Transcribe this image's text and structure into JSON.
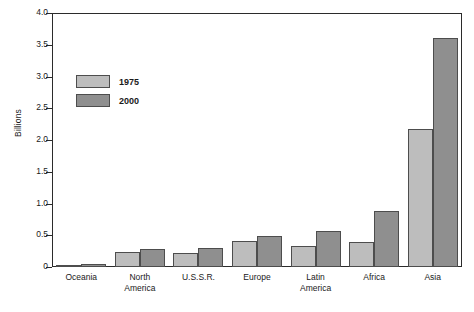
{
  "chart_data": {
    "type": "bar",
    "title": "",
    "xlabel": "",
    "ylabel": "Billions",
    "ylim": [
      0,
      4.0
    ],
    "ytick_labels": [
      "4.0",
      "3.5",
      "3.0",
      "2.5",
      "2.0",
      "1.5",
      "1.0",
      "0.5",
      "0"
    ],
    "ytick_values": [
      4.0,
      3.5,
      3.0,
      2.5,
      2.0,
      1.5,
      1.0,
      0.5,
      0
    ],
    "grid": false,
    "legend_position": "upper-left-inside",
    "categories": [
      "Oceania",
      "North America",
      "U.S.S.R.",
      "Europe",
      "Latin America",
      "Africa",
      "Asia"
    ],
    "category_lines": [
      [
        "Oceania"
      ],
      [
        "North",
        "America"
      ],
      [
        "U.S.S.R."
      ],
      [
        "Europe"
      ],
      [
        "Latin",
        "America"
      ],
      [
        "Africa"
      ],
      [
        "Asia"
      ]
    ],
    "series": [
      {
        "name": "1975",
        "color": "#bdbdbd",
        "values": [
          0.02,
          0.23,
          0.22,
          0.41,
          0.33,
          0.39,
          2.18
        ]
      },
      {
        "name": "2000",
        "color": "#8f8f8f",
        "values": [
          0.04,
          0.28,
          0.3,
          0.49,
          0.56,
          0.89,
          3.6
        ]
      }
    ]
  },
  "legend": {
    "items": [
      {
        "label": "1975",
        "color": "#bdbdbd"
      },
      {
        "label": "2000",
        "color": "#8f8f8f"
      }
    ]
  },
  "axis": {
    "y_title": "Billions"
  },
  "colors": {
    "series_1975": "#bdbdbd",
    "series_2000": "#8f8f8f",
    "axis_line": "#2b2b2b",
    "bar_border": "#4d4d4d",
    "text": "#1a1a1a",
    "background": "#ffffff"
  }
}
